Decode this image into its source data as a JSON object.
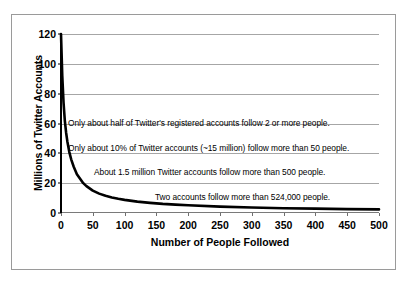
{
  "chart_data": {
    "type": "line",
    "title": "",
    "xlabel": "Number of People Followed",
    "ylabel": "Millions of Twitter Accounts",
    "xlim": [
      0,
      500
    ],
    "ylim": [
      0,
      120
    ],
    "grid": true,
    "legend": "none",
    "x_ticks": [
      "0",
      "50",
      "100",
      "150",
      "200",
      "250",
      "300",
      "350",
      "400",
      "450",
      "500"
    ],
    "y_ticks": [
      "0",
      "20",
      "40",
      "60",
      "80",
      "100",
      "120"
    ],
    "series": [
      {
        "name": "Twitter accounts by number followed",
        "color": "#000000",
        "x": [
          0,
          2,
          4,
          6,
          8,
          10,
          13,
          16,
          20,
          25,
          30,
          35,
          40,
          50,
          60,
          70,
          80,
          90,
          100,
          120,
          140,
          160,
          180,
          200,
          250,
          300,
          350,
          400,
          450,
          500
        ],
        "values": [
          120,
          92,
          74,
          62,
          54,
          48,
          41,
          36,
          31,
          26,
          23,
          20,
          18,
          15,
          13,
          11.5,
          10.4,
          9.5,
          8.8,
          7.6,
          6.8,
          6.1,
          5.6,
          5.2,
          4.3,
          3.7,
          3.2,
          2.9,
          2.6,
          2.4
        ]
      }
    ],
    "annotations": [
      "Only about half of Twitter's registered accounts follow 2 or more people.",
      "Only about 10% of Twitter accounts (~15 million) follow more than 50 people.",
      "About 1.5 million Twitter accounts follow more than 500 people.",
      "Two accounts follow more than 524,000 people."
    ]
  }
}
